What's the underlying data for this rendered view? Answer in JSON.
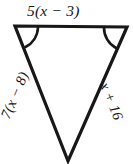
{
  "figure": {
    "kind": "geometry-diagram",
    "shape": "triangle",
    "orientation": "apex-down",
    "background_color": "#ffffff",
    "stroke_color": "#171717",
    "stroke_width": 3,
    "vertices": {
      "top_left": {
        "x": 15,
        "y": 26
      },
      "top_right": {
        "x": 127,
        "y": 27
      },
      "apex_bottom": {
        "x": 68,
        "y": 161
      }
    },
    "angle_marks": [
      {
        "at": "top_left",
        "arcs": 1,
        "meaning": "congruent-angle"
      },
      {
        "at": "top_right",
        "arcs": 1,
        "meaning": "congruent-angle"
      }
    ]
  },
  "labels": {
    "top_side": "5(x − 3)",
    "left_side": "7(x − 8)",
    "right_side": "x + 16"
  }
}
